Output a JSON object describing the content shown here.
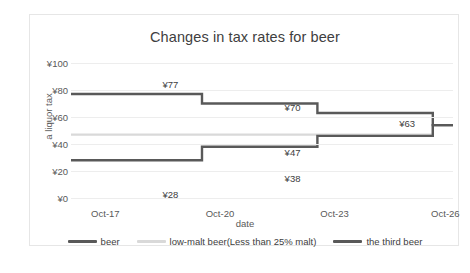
{
  "chart_data": {
    "type": "line",
    "title": "Changes in tax rates for beer",
    "xlabel": "date",
    "ylabel": "a liquor tax",
    "x": [
      "Oct-17",
      "Oct-20",
      "Oct-23",
      "Oct-26"
    ],
    "xtick_labels": [
      "Oct-17",
      "Oct-20",
      "Oct-23",
      "Oct-26"
    ],
    "ytick_labels": [
      "¥100",
      "¥80",
      "¥60",
      "¥40",
      "¥20",
      "¥0"
    ],
    "ylim": [
      0,
      100
    ],
    "ytick_values": [
      100,
      80,
      60,
      40,
      20,
      0
    ],
    "grid": true,
    "step_style": "post",
    "legend_position": "bottom",
    "series": [
      {
        "name": "beer",
        "color": "#595959",
        "values": [
          77,
          70,
          63,
          54
        ],
        "labels": [
          "¥77",
          "¥70",
          "¥63",
          "¥54"
        ]
      },
      {
        "name": "low-malt beer(Less than 25% malt)",
        "color": "#d9d9d9",
        "values": [
          47,
          47,
          47,
          54
        ],
        "labels": [
          "¥47"
        ]
      },
      {
        "name": "the third beer",
        "color": "#595959",
        "values": [
          28,
          38,
          46,
          54
        ],
        "labels": [
          "¥28",
          "¥38"
        ]
      }
    ],
    "annotations": [
      {
        "text": "¥77",
        "x_pct": 26,
        "y_px": 16
      },
      {
        "text": "¥70",
        "x_pct": 58,
        "y_px": 39
      },
      {
        "text": "¥63",
        "x_pct": 88,
        "y_px": 55
      },
      {
        "text": "¥54",
        "x_pct": 117,
        "y_px": 72
      },
      {
        "text": "¥47",
        "x_pct": 58,
        "y_px": 84
      },
      {
        "text": "¥38",
        "x_pct": 58,
        "y_px": 110
      },
      {
        "text": "¥28",
        "x_pct": 26,
        "y_px": 126
      }
    ]
  },
  "legend": {
    "items": [
      {
        "label": "beer",
        "color": "#595959"
      },
      {
        "label": "low-malt beer(Less than 25% malt)",
        "color": "#d9d9d9"
      },
      {
        "label": "the third beer",
        "color": "#595959"
      }
    ]
  },
  "caption": {
    "text": ""
  }
}
